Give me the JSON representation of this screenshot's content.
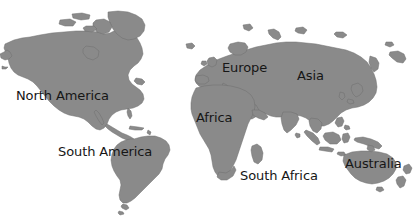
{
  "map": {
    "width": 416,
    "height": 218,
    "background_color": "#ffffff",
    "land_fill_color": "#8a8a8a",
    "land_outline_color": "#6f6f6f",
    "label_text_color": "#161616",
    "projection_note": "world-map-grayscale-silhouette"
  },
  "labels": [
    {
      "id": "north-america",
      "text": "North America",
      "x": 16,
      "y": 89,
      "font_size": 13
    },
    {
      "id": "south-america",
      "text": "South America",
      "x": 58,
      "y": 145,
      "font_size": 13
    },
    {
      "id": "europe",
      "text": "Europe",
      "x": 222,
      "y": 61,
      "font_size": 13
    },
    {
      "id": "asia",
      "text": "Asia",
      "x": 297,
      "y": 69,
      "font_size": 13
    },
    {
      "id": "africa",
      "text": "Africa",
      "x": 196,
      "y": 111,
      "font_size": 13
    },
    {
      "id": "south-africa",
      "text": "South Africa",
      "x": 240,
      "y": 169,
      "font_size": 13
    },
    {
      "id": "australia",
      "text": "Australia",
      "x": 345,
      "y": 157,
      "font_size": 13
    }
  ],
  "continents": [
    {
      "id": "north-america",
      "name": "North America"
    },
    {
      "id": "south-america",
      "name": "South America"
    },
    {
      "id": "greenland-arctic",
      "name": "Arctic Islands"
    },
    {
      "id": "eurasia",
      "name": "Eurasia"
    },
    {
      "id": "africa",
      "name": "Africa"
    },
    {
      "id": "madagascar",
      "name": "Madagascar"
    },
    {
      "id": "indonesia",
      "name": "Indonesian Archipelago"
    },
    {
      "id": "australia",
      "name": "Australia"
    },
    {
      "id": "new-zealand",
      "name": "New Zealand"
    },
    {
      "id": "japan",
      "name": "Japan"
    },
    {
      "id": "british-isles",
      "name": "British Isles"
    }
  ]
}
